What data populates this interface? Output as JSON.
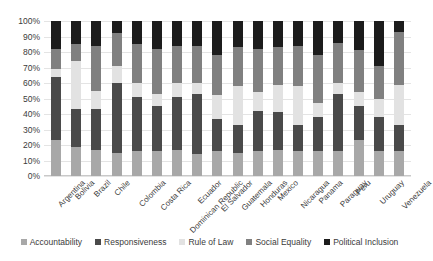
{
  "chart_data": {
    "type": "bar",
    "subtype": "stacked-100-percent",
    "title": "",
    "xlabel": "",
    "ylabel": "",
    "ylim": [
      0,
      100
    ],
    "ytick_labels": [
      "0%",
      "10%",
      "20%",
      "30%",
      "40%",
      "50%",
      "60%",
      "70%",
      "80%",
      "90%",
      "100%"
    ],
    "ytick_values": [
      0,
      10,
      20,
      30,
      40,
      50,
      60,
      70,
      80,
      90,
      100
    ],
    "grid": true,
    "legend_position": "bottom",
    "categories": [
      "Argentina",
      "Bolivia",
      "Brazil",
      "Chile",
      "Colombia",
      "Costa Rica",
      "Dominican Republic",
      "Ecuador",
      "El Salvador",
      "Guatemala",
      "Honduras",
      "Mexico",
      "Nicaragua",
      "Panama",
      "Paraguay",
      "Peru",
      "Uruguay",
      "Venezuela"
    ],
    "series": [
      {
        "name": "Accountability",
        "color": "#a8a8a8",
        "values": [
          23,
          19,
          17,
          15,
          16,
          16,
          17,
          14,
          16,
          15,
          16,
          17,
          16,
          16,
          16,
          23,
          16,
          16
        ]
      },
      {
        "name": "Responsiveness",
        "color": "#4a4a4a",
        "values": [
          41,
          24,
          26,
          45,
          35,
          29,
          34,
          39,
          21,
          18,
          26,
          24,
          17,
          22,
          37,
          22,
          22,
          17
        ]
      },
      {
        "name": "Rule of Law",
        "color": "#e2e2e2",
        "values": [
          5,
          31,
          12,
          11,
          9,
          8,
          9,
          7,
          15,
          25,
          12,
          18,
          25,
          9,
          7,
          9,
          12,
          26
        ]
      },
      {
        "name": "Social Equality",
        "color": "#808080",
        "values": [
          13,
          11,
          29,
          21,
          25,
          29,
          24,
          24,
          26,
          25,
          28,
          24,
          26,
          31,
          26,
          27,
          21,
          34
        ]
      },
      {
        "name": "Political Inclusion",
        "color": "#1c1c1c",
        "values": [
          18,
          15,
          16,
          8,
          15,
          18,
          16,
          16,
          22,
          17,
          18,
          17,
          16,
          22,
          14,
          19,
          29,
          7
        ]
      }
    ]
  }
}
